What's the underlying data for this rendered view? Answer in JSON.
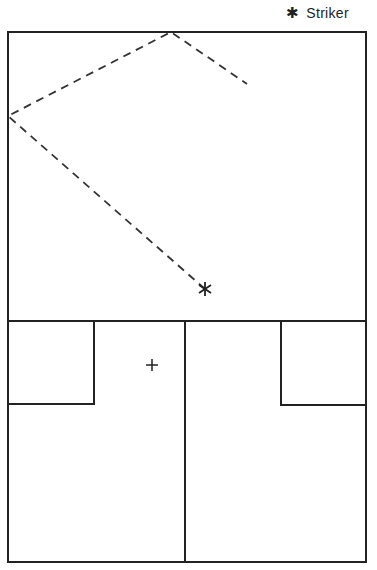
{
  "legend": {
    "items": [
      {
        "symbol": "✱",
        "label": "Striker",
        "icon": "asterisk-icon"
      }
    ]
  },
  "colors": {
    "line": "#222222",
    "background": "#ffffff"
  },
  "court": {
    "outer": {
      "x1": 8,
      "y1": 32,
      "x2": 366,
      "y2": 562
    },
    "short_line_y": 321,
    "half_court_line_x": 185,
    "left_service_box": {
      "x1": 8,
      "y1": 321,
      "x2": 94,
      "y2": 404
    },
    "right_service_box": {
      "x1": 281,
      "y1": 321,
      "x2": 366,
      "y2": 405
    }
  },
  "markers": {
    "striker": {
      "x": 205,
      "y": 289,
      "symbol": "✱"
    },
    "target": {
      "x": 152,
      "y": 365,
      "symbol": "+"
    }
  },
  "ball_path": {
    "style": "dashed",
    "points": [
      [
        205,
        289
      ],
      [
        8,
        116
      ],
      [
        171,
        32
      ],
      [
        247,
        84
      ]
    ]
  }
}
